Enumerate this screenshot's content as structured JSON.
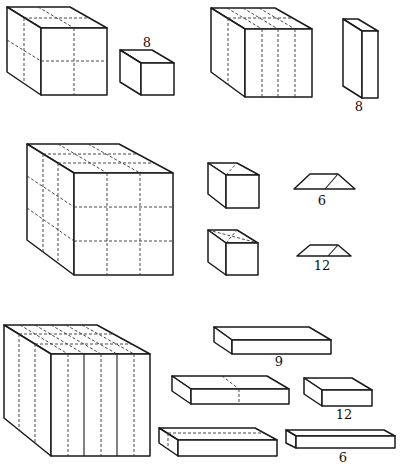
{
  "figure": {
    "rows": [
      {
        "big_cube": {
          "name": "2x2x2 cube",
          "divisions": [
            2,
            2,
            2
          ]
        },
        "pieces": [
          {
            "name": "corner cube",
            "label": "8"
          }
        ],
        "second_cube": {
          "name": "cube cut into 4 vertical slabs",
          "divisions": [
            4,
            1,
            1
          ]
        },
        "second_pieces": [
          {
            "name": "slab",
            "label": "8"
          }
        ]
      },
      {
        "big_cube": {
          "name": "3x3x3 cube",
          "divisions": [
            3,
            3,
            3
          ]
        },
        "pieces": [
          {
            "name": "small cube (one diagonal)",
            "label": ""
          },
          {
            "name": "small cube (two diagonals)",
            "label": ""
          },
          {
            "name": "prism piece",
            "label": "6"
          },
          {
            "name": "prism piece small",
            "label": "12"
          }
        ]
      },
      {
        "big_cube": {
          "name": "cube cut into 6 vertical slabs",
          "divisions": [
            6,
            1,
            1
          ]
        },
        "pieces": [
          {
            "name": "long bar",
            "label": "9"
          },
          {
            "name": "bar with dashed divider",
            "label": ""
          },
          {
            "name": "short bar",
            "label": "12"
          },
          {
            "name": "bar with dashed inner edge",
            "label": ""
          },
          {
            "name": "thin long bar",
            "label": "6"
          }
        ]
      }
    ],
    "labels": {
      "row1_cube_count": "8",
      "row1_slab_count": "8",
      "row2_prism_count": "6",
      "row2_prism_small_count": "12",
      "row3_bar_long_count": "9",
      "row3_bar_short_count": "12",
      "row3_bar_thin_count": "6"
    }
  }
}
